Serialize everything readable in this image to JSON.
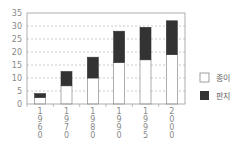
{
  "chart_data": {
    "type": "bar",
    "stacked": true,
    "title": "",
    "xlabel": "",
    "ylabel": "",
    "categories": [
      "1960",
      "1970",
      "1980",
      "1990",
      "1995",
      "2000"
    ],
    "series": [
      {
        "name": "종이",
        "color": "#ffffff",
        "values": [
          2.5,
          7,
          10,
          16,
          17,
          19
        ]
      },
      {
        "name": "판지",
        "color": "#333333",
        "values": [
          1.5,
          5.5,
          8,
          12,
          12.5,
          13
        ]
      }
    ],
    "ylim": [
      0,
      35
    ],
    "yticks": [
      0,
      5,
      10,
      15,
      20,
      25,
      30,
      35
    ],
    "grid": true,
    "legend_position": "right"
  },
  "legend": {
    "items": [
      {
        "label": "종이"
      },
      {
        "label": "판지"
      }
    ]
  }
}
